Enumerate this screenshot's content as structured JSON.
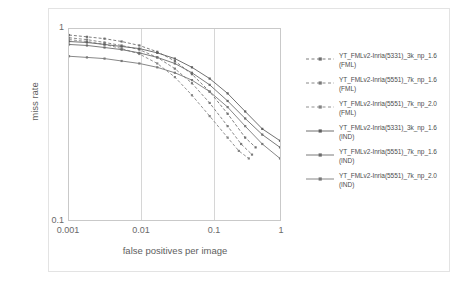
{
  "chart_data": {
    "type": "line",
    "title": "",
    "xlabel": "false positives per image",
    "ylabel": "miss rate",
    "xscale": "log",
    "yscale": "log",
    "xlim": [
      0.001,
      1
    ],
    "ylim": [
      0.1,
      1
    ],
    "xticks": [
      "0.001",
      "0.01",
      "0.1",
      "1"
    ],
    "yticks": [
      "0.1",
      "1"
    ],
    "grid": "vertical-only",
    "legend_position": "right",
    "series": [
      {
        "name": "YT_FMLv2-Inria(5331)_3k_np_1.6 (FML)",
        "label_line1": "YT_FMLv2-Inria(5331)_3k_np_1.6",
        "label_line2": "(FML)",
        "style": "dashed",
        "marker": "square",
        "color": "#6e6e6e",
        "x": [
          0.001,
          0.0018,
          0.0032,
          0.0056,
          0.01,
          0.018,
          0.032,
          0.056,
          0.1,
          0.18,
          0.32,
          0.45
        ],
        "y": [
          0.93,
          0.91,
          0.89,
          0.86,
          0.82,
          0.76,
          0.68,
          0.58,
          0.47,
          0.36,
          0.27,
          0.24
        ]
      },
      {
        "name": "YT_FMLv2-Inria(5551)_7k_np_1.6 (FML)",
        "label_line1": "YT_FMLv2-Inria(5551)_7k_np_1.6",
        "label_line2": "(FML)",
        "style": "dashed",
        "marker": "square",
        "color": "#7a7a7a",
        "x": [
          0.001,
          0.0018,
          0.0032,
          0.0056,
          0.01,
          0.018,
          0.032,
          0.056,
          0.1,
          0.18,
          0.28,
          0.4
        ],
        "y": [
          0.9,
          0.88,
          0.85,
          0.82,
          0.78,
          0.71,
          0.62,
          0.52,
          0.41,
          0.31,
          0.25,
          0.22
        ]
      },
      {
        "name": "YT_FMLv2-Inria(5551)_7k_np_2.0 (FML)",
        "label_line1": "YT_FMLv2-Inria(5551)_7k_np_2.0",
        "label_line2": "(FML)",
        "style": "dashed",
        "marker": "square",
        "color": "#848484",
        "x": [
          0.001,
          0.0018,
          0.0032,
          0.0056,
          0.01,
          0.018,
          0.032,
          0.056,
          0.1,
          0.18,
          0.26,
          0.36
        ],
        "y": [
          0.88,
          0.86,
          0.83,
          0.79,
          0.74,
          0.66,
          0.56,
          0.45,
          0.35,
          0.27,
          0.23,
          0.21
        ]
      },
      {
        "name": "YT_FMLv2-Inria(5331)_3k_np_1.6 (IND)",
        "label_line1": "YT_FMLv2-Inria(5331)_3k_np_1.6",
        "label_line2": "(IND)",
        "style": "solid",
        "marker": "square",
        "color": "#5f5f5f",
        "x": [
          0.001,
          0.0018,
          0.0032,
          0.0056,
          0.01,
          0.018,
          0.032,
          0.056,
          0.1,
          0.18,
          0.32,
          0.56,
          1.0
        ],
        "y": [
          0.86,
          0.85,
          0.83,
          0.81,
          0.79,
          0.75,
          0.7,
          0.63,
          0.55,
          0.46,
          0.37,
          0.3,
          0.26
        ]
      },
      {
        "name": "YT_FMLv2-Inria(5551)_7k_np_1.6 (IND)",
        "label_line1": "YT_FMLv2-Inria(5551)_7k_np_1.6",
        "label_line2": "(IND)",
        "style": "solid",
        "marker": "square",
        "color": "#6b6b6b",
        "x": [
          0.001,
          0.0018,
          0.0032,
          0.0056,
          0.01,
          0.018,
          0.032,
          0.056,
          0.1,
          0.18,
          0.32,
          0.56,
          1.0
        ],
        "y": [
          0.83,
          0.82,
          0.8,
          0.78,
          0.75,
          0.71,
          0.66,
          0.59,
          0.51,
          0.42,
          0.34,
          0.28,
          0.24
        ]
      },
      {
        "name": "YT_FMLv2-Inria(5551)_7k_np_2.0 (IND)",
        "label_line1": "YT_FMLv2-Inria(5551)_7k_np_2.0",
        "label_line2": "(IND)",
        "style": "solid",
        "marker": "square",
        "color": "#787878",
        "x": [
          0.001,
          0.0018,
          0.0032,
          0.0056,
          0.01,
          0.018,
          0.032,
          0.056,
          0.1,
          0.18,
          0.32,
          0.56,
          1.0
        ],
        "y": [
          0.72,
          0.71,
          0.7,
          0.68,
          0.66,
          0.63,
          0.59,
          0.54,
          0.47,
          0.39,
          0.31,
          0.25,
          0.21
        ]
      }
    ]
  },
  "axes": {
    "ytick_top": "1",
    "ytick_bottom": "0.1",
    "xticks": [
      "0.001",
      "0.01",
      "0.1",
      "1"
    ],
    "xlabel": "false positives per image",
    "ylabel": "miss rate"
  }
}
